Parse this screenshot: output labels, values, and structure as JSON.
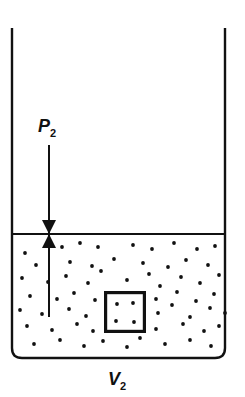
{
  "figure": {
    "type": "physics-diagram",
    "background_color": "#ffffff",
    "stroke_color": "#111111"
  },
  "container": {
    "name": "open-top-vessel",
    "left_wall_x": 12,
    "right_wall_x": 225,
    "top_y": 28,
    "bottom_y": 358,
    "corner_radius": 10,
    "stroke_width": 2.4
  },
  "surface": {
    "name": "gas-liquid-interface",
    "y": 234,
    "x_start": 12,
    "x_end": 225,
    "stroke_width": 1.8
  },
  "pressure_arrow": {
    "label_text": "P",
    "label_subscript": "2",
    "label_x": 38,
    "label_y": 132,
    "line_x": 49,
    "line_top_y": 145,
    "line_bottom_y": 317,
    "stroke_width": 2.0,
    "arrowhead_down_tip_y": 234,
    "arrowhead_up_tip_y": 234,
    "arrowhead_half_width": 7,
    "arrowhead_length": 14
  },
  "volume_label": {
    "label_text": "V",
    "label_subscript": "2",
    "label_x": 108,
    "label_y": 385
  },
  "inner_box": {
    "name": "sample-volume-element",
    "x": 104,
    "y": 291,
    "width": 42,
    "height": 42,
    "stroke_width": 3.2,
    "dots": [
      [
        13,
        13
      ],
      [
        29,
        12
      ],
      [
        12,
        30
      ],
      [
        30,
        31
      ]
    ]
  },
  "particles": {
    "radius": 1.9,
    "color": "#111111",
    "points": [
      [
        25,
        253
      ],
      [
        62,
        247
      ],
      [
        80,
        243
      ],
      [
        98,
        247
      ],
      [
        133,
        245
      ],
      [
        152,
        249
      ],
      [
        174,
        243
      ],
      [
        197,
        249
      ],
      [
        215,
        246
      ],
      [
        36,
        265
      ],
      [
        70,
        262
      ],
      [
        92,
        266
      ],
      [
        114,
        259
      ],
      [
        143,
        263
      ],
      [
        168,
        267
      ],
      [
        186,
        260
      ],
      [
        208,
        265
      ],
      [
        22,
        278
      ],
      [
        48,
        282
      ],
      [
        66,
        276
      ],
      [
        88,
        283
      ],
      [
        101,
        271
      ],
      [
        127,
        280
      ],
      [
        149,
        274
      ],
      [
        160,
        286
      ],
      [
        181,
        277
      ],
      [
        200,
        283
      ],
      [
        219,
        275
      ],
      [
        30,
        296
      ],
      [
        57,
        299
      ],
      [
        74,
        293
      ],
      [
        95,
        300
      ],
      [
        120,
        295
      ],
      [
        156,
        299
      ],
      [
        177,
        292
      ],
      [
        196,
        301
      ],
      [
        214,
        294
      ],
      [
        20,
        310
      ],
      [
        42,
        314
      ],
      [
        69,
        309
      ],
      [
        86,
        316
      ],
      [
        158,
        313
      ],
      [
        172,
        305
      ],
      [
        190,
        317
      ],
      [
        210,
        308
      ],
      [
        225,
        313
      ],
      [
        27,
        326
      ],
      [
        52,
        330
      ],
      [
        77,
        324
      ],
      [
        93,
        331
      ],
      [
        121,
        327
      ],
      [
        156,
        329
      ],
      [
        183,
        324
      ],
      [
        204,
        331
      ],
      [
        219,
        326
      ],
      [
        34,
        344
      ],
      [
        60,
        340
      ],
      [
        84,
        346
      ],
      [
        103,
        341
      ],
      [
        127,
        347
      ],
      [
        140,
        338
      ],
      [
        165,
        344
      ],
      [
        190,
        340
      ],
      [
        211,
        346
      ]
    ]
  }
}
